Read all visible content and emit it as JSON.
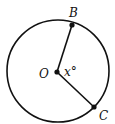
{
  "diagram": {
    "center": {
      "label": "O",
      "x": 57,
      "y": 72
    },
    "radius": 51,
    "points": [
      {
        "label": "B",
        "x": 72,
        "y": 25
      },
      {
        "label": "C",
        "x": 94,
        "y": 107
      }
    ],
    "angle_label": "x°",
    "stroke_color": "#111111"
  }
}
